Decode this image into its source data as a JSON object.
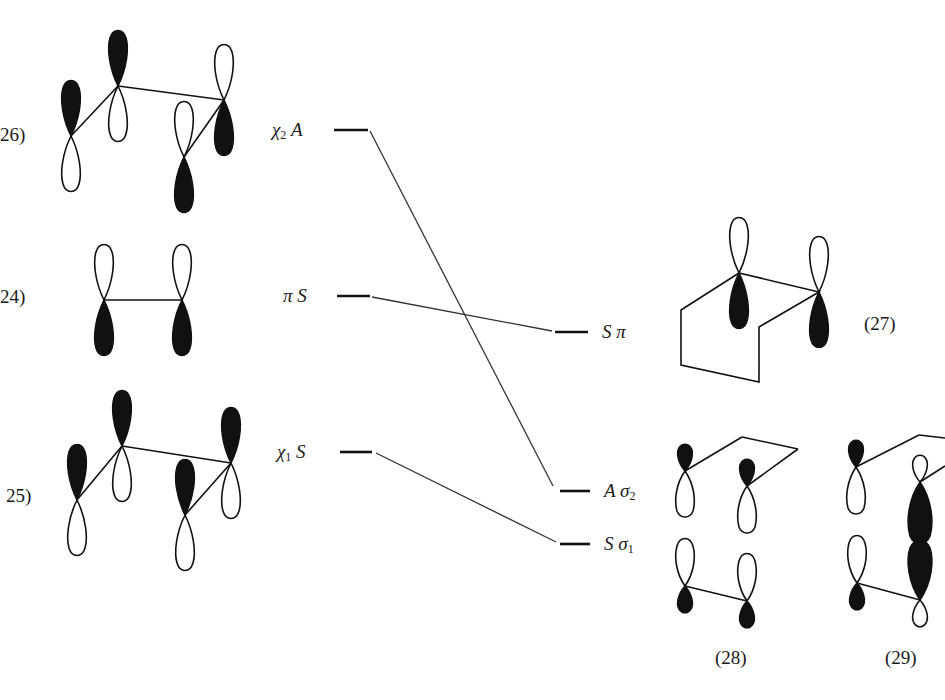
{
  "figure": {
    "structures": [
      {
        "id": "26",
        "label": "26)",
        "description": "butadiene-like p-orbital set, antisymmetric combination"
      },
      {
        "id": "24",
        "label": "24)",
        "description": "ethylene pi orbital"
      },
      {
        "id": "25",
        "label": "25)",
        "description": "butadiene-like p-orbital set, symmetric combination"
      },
      {
        "id": "27",
        "label": "(27)",
        "description": "cyclobutene-type pi orbital on ring"
      },
      {
        "id": "28",
        "label": "(28)",
        "description": "sigma bonding combination sigma1"
      },
      {
        "id": "29",
        "label": "(29)",
        "description": "sigma combination sigma2"
      }
    ],
    "left_levels": [
      {
        "name": "chi2",
        "symbol": "χ",
        "subscript": "2",
        "symmetry": "A",
        "y": 130
      },
      {
        "name": "pi",
        "symbol": "π",
        "subscript": "",
        "symmetry": "S",
        "y": 296
      },
      {
        "name": "chi1",
        "symbol": "χ",
        "subscript": "1",
        "symmetry": "S",
        "y": 452
      }
    ],
    "right_levels": [
      {
        "name": "pi",
        "symmetry": "S",
        "symbol": "π",
        "subscript": "",
        "y": 332
      },
      {
        "name": "sigma2",
        "symmetry": "A",
        "symbol": "σ",
        "subscript": "2",
        "y": 491
      },
      {
        "name": "sigma1",
        "symmetry": "S",
        "symbol": "σ",
        "subscript": "1",
        "y": 544
      }
    ],
    "correlations": [
      {
        "from": "chi2",
        "to": "sigma2"
      },
      {
        "from": "pi",
        "to": "pi"
      },
      {
        "from": "chi1",
        "to": "sigma1"
      }
    ],
    "colors": {
      "ink": "#111111",
      "line": "#333333",
      "background": "#ffffff"
    }
  },
  "labels": {
    "n26": "26)",
    "n24": "24)",
    "n25": "25)",
    "n27": "(27)",
    "n28": "(28)",
    "n29": "(29)",
    "l_chi2_sym": "χ",
    "l_chi2_sub": "2",
    "l_chi2_irr": "A",
    "l_pi_sym": "π",
    "l_pi_irr": "S",
    "l_chi1_sym": "χ",
    "l_chi1_sub": "1",
    "l_chi1_irr": "S",
    "r_pi_irr": "S",
    "r_pi_sym": "π",
    "r_s2_irr": "A",
    "r_s2_sym": "σ",
    "r_s2_sub": "2",
    "r_s1_irr": "S",
    "r_s1_sym": "σ",
    "r_s1_sub": "1"
  }
}
